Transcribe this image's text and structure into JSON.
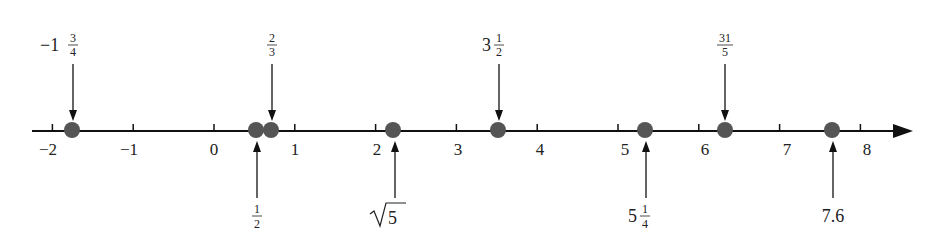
{
  "figure": {
    "type": "number-line",
    "axis": {
      "min": -2,
      "max": 8,
      "ticks": [
        "-2",
        "-1",
        "0",
        "1",
        "2",
        "3",
        "4",
        "5",
        "6",
        "7",
        "8"
      ],
      "tick_labels_display": [
        "−2",
        "−1",
        "0",
        "1",
        "2",
        "3",
        "4",
        "5",
        "6",
        "7",
        "8"
      ],
      "arrow": "right"
    },
    "points": [
      {
        "id": "neg-one-three-quarters",
        "value": -1.75,
        "label_whole": "−1",
        "label_num": "3",
        "label_den": "4",
        "label_position": "above"
      },
      {
        "id": "one-half",
        "value": 0.5,
        "label_whole": "",
        "label_num": "1",
        "label_den": "2",
        "label_position": "below"
      },
      {
        "id": "two-thirds",
        "value": 0.6667,
        "label_whole": "",
        "label_num": "2",
        "label_den": "3",
        "label_position": "above"
      },
      {
        "id": "sqrt-five",
        "value": 2.236,
        "label_text": "√5",
        "label_radicand": "5",
        "label_position": "below"
      },
      {
        "id": "three-and-half",
        "value": 3.5,
        "label_whole": "3",
        "label_num": "1",
        "label_den": "2",
        "label_position": "above"
      },
      {
        "id": "five-and-quarter",
        "value": 5.25,
        "label_whole": "5",
        "label_num": "1",
        "label_den": "4",
        "label_position": "below"
      },
      {
        "id": "thirty-one-fifths",
        "value": 6.2,
        "label_whole": "",
        "label_num": "31",
        "label_den": "5",
        "label_position": "above"
      },
      {
        "id": "seven-point-six",
        "value": 7.6,
        "label_text": "7.6",
        "label_position": "below"
      }
    ],
    "colors": {
      "axis": "#111111",
      "dot": "#555555",
      "text": "#222222"
    }
  }
}
